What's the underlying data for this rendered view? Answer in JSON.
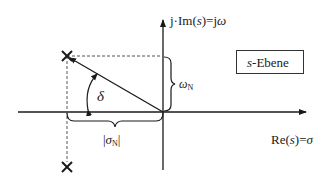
{
  "diagram": {
    "plane_label": {
      "var": "s",
      "text": "-Ebene"
    },
    "axes": {
      "imaginary": {
        "prefix": "j·Im(",
        "var": "s",
        "middle": ")=j",
        "symbol": "ω"
      },
      "real": {
        "prefix": "Re(",
        "var": "s",
        "middle": ")=",
        "symbol": "σ"
      }
    },
    "annotations": {
      "angle": "δ",
      "omega": {
        "symbol": "ω",
        "subscript": "N"
      },
      "sigma": {
        "left": "|",
        "symbol": "σ",
        "subscript": "N",
        "right": "|"
      }
    },
    "poles": [
      {
        "name": "upper-pole",
        "marker": "×"
      },
      {
        "name": "lower-pole",
        "marker": "×"
      }
    ],
    "colors": {
      "line": "#1a1a1a",
      "dashed": "#555555",
      "background": "#ffffff"
    }
  }
}
